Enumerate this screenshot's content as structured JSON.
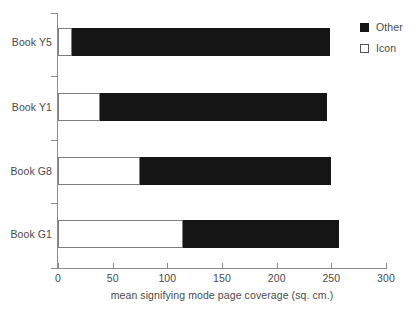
{
  "chart_data": {
    "type": "bar",
    "orientation": "horizontal",
    "stacked": true,
    "title": "",
    "xlabel": "mean signifying mode page coverage (sq. cm.)",
    "ylabel": "",
    "xlim": [
      0,
      300
    ],
    "xticks": [
      0,
      50,
      100,
      150,
      200,
      250,
      300
    ],
    "xticklabels": [
      "0",
      "50",
      "100",
      "150",
      "200",
      "250",
      "300"
    ],
    "categories": [
      "Book G1",
      "Book G8",
      "Book Y1",
      "Book Y5"
    ],
    "categories_top_to_bottom": [
      "Book Y5",
      "Book Y1",
      "Book G8",
      "Book G1"
    ],
    "series": [
      {
        "name": "Icon",
        "color": "#ffffff",
        "edge_color": "#7d7d7d",
        "values_top_to_bottom": [
          13,
          38,
          75,
          114
        ]
      },
      {
        "name": "Other",
        "color": "#151515",
        "values_top_to_bottom": [
          236,
          208,
          175,
          143
        ]
      }
    ],
    "totals_top_to_bottom": [
      249,
      246,
      250,
      257
    ],
    "grid": false,
    "legend_position": "upper right",
    "legend_entries": [
      "Other",
      "Icon"
    ]
  },
  "rows": [
    {
      "label": "Book Y5",
      "icon": 13,
      "other": 236,
      "total": 249,
      "top": 28
    },
    {
      "label": "Book Y1",
      "icon": 38,
      "other": 208,
      "total": 246,
      "top": 93
    },
    {
      "label": "Book G8",
      "icon": 75,
      "other": 175,
      "total": 250,
      "top": 157
    },
    {
      "label": "Book G1",
      "icon": 114,
      "other": 143,
      "total": 257,
      "top": 220
    }
  ],
  "axis": {
    "x_title": "mean signifying mode page coverage (sq. cm.)",
    "ticks": [
      {
        "value": "0",
        "px": 58
      },
      {
        "value": "50",
        "px": 112.7
      },
      {
        "value": "100",
        "px": 167.3
      },
      {
        "value": "150",
        "px": 222
      },
      {
        "value": "200",
        "px": 276.7
      },
      {
        "value": "250",
        "px": 331.3
      },
      {
        "value": "300",
        "px": 386
      }
    ]
  },
  "legend": {
    "items": [
      {
        "label": "Other",
        "swatch": "filled-square-icon"
      },
      {
        "label": "Icon",
        "swatch": "outlined-square-icon"
      }
    ]
  },
  "colors": {
    "other": "#151515",
    "icon": "#ffffff",
    "axis": "#8c8c8c",
    "text": "#4a4a4a",
    "background": "#ffffff"
  }
}
